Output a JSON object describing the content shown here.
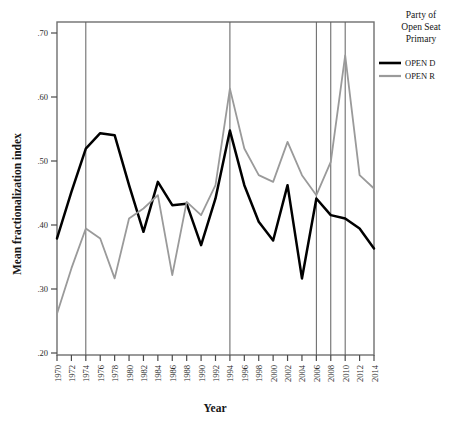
{
  "chart_data": {
    "type": "line",
    "title": "",
    "xlabel": "Year",
    "ylabel": "Mean fractionalization index",
    "xlim": [
      1970,
      2014
    ],
    "ylim": [
      0.2,
      0.7
    ],
    "grid": false,
    "legend_position": "right",
    "legend_title": "Party of Open Seat Primary",
    "x": [
      1970,
      1972,
      1974,
      1976,
      1978,
      1980,
      1982,
      1984,
      1986,
      1988,
      1990,
      1992,
      1994,
      1996,
      1998,
      2000,
      2002,
      2004,
      2006,
      2008,
      2010,
      2012,
      2014
    ],
    "xtick_labels": [
      "1970",
      "1972",
      "1974",
      "1976",
      "1978",
      "1980",
      "1982",
      "1984",
      "1986",
      "1988",
      "1990",
      "1992",
      "1994",
      "1996",
      "1998",
      "2000",
      "2002",
      "2004",
      "2006",
      "2008",
      "2010",
      "2012",
      "2014"
    ],
    "ytick_labels": [
      ".20",
      ".30",
      ".40",
      ".50",
      ".60",
      ".70"
    ],
    "ytick_values": [
      0.2,
      0.3,
      0.4,
      0.5,
      0.6,
      0.7
    ],
    "reference_lines": [
      1974,
      1994,
      2006,
      2008,
      2010
    ],
    "series": [
      {
        "name": "OPEN D",
        "color": "#000000",
        "values": [
          0.375,
          0.445,
          0.51,
          0.533,
          0.53,
          0.455,
          0.385,
          0.46,
          0.425,
          0.427,
          0.365,
          0.435,
          0.537,
          0.455,
          0.4,
          0.372,
          0.455,
          0.315,
          0.435,
          0.41,
          0.405,
          0.39,
          0.36
        ]
      },
      {
        "name": "OPEN R",
        "color": "#9a9a9a",
        "values": [
          0.262,
          0.33,
          0.39,
          0.375,
          0.315,
          0.405,
          0.42,
          0.44,
          0.32,
          0.43,
          0.41,
          0.455,
          0.6,
          0.51,
          0.47,
          0.46,
          0.52,
          0.47,
          0.44,
          0.49,
          0.65,
          0.47,
          0.45
        ]
      }
    ]
  },
  "legend": {
    "title_lines": [
      "Party of",
      "Open Seat",
      "Primary"
    ],
    "entries": [
      {
        "label": "OPEN D",
        "color": "#000000"
      },
      {
        "label": "OPEN R",
        "color": "#9a9a9a"
      }
    ]
  },
  "caption": {
    "text": ""
  }
}
